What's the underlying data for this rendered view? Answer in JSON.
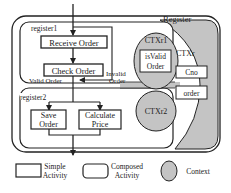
{
  "diagram": {
    "outer_label": "Register",
    "context_main": "CTXr",
    "register1": {
      "label": "register1",
      "activities": [
        "Receive Order",
        "Check Order"
      ],
      "context": "CTXr1",
      "context_item": [
        "isValid",
        "Order"
      ],
      "valid_label": "Valid Order",
      "invalid_label": [
        "Invalid",
        "Order"
      ]
    },
    "register2": {
      "label": "register2",
      "activities": [
        [
          "Save",
          "Order"
        ],
        [
          "Calculate",
          "Price"
        ]
      ],
      "context": "CTXr2"
    },
    "context_items": [
      "Cno",
      "order"
    ]
  },
  "legend": {
    "simple": [
      "Simple",
      "Activity"
    ],
    "composed": [
      "Composed",
      "Activity"
    ],
    "context": "Context"
  },
  "colors": {
    "context_fill": "#c4c4c4",
    "stroke": "#222222"
  }
}
